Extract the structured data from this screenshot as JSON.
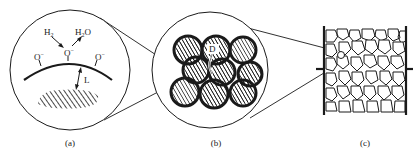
{
  "panels": [
    {
      "id": "a",
      "caption": "(a)",
      "labels": {
        "h2": "H",
        "h2_sub": "2",
        "h2o_pre": "H",
        "h2o_sub": "2",
        "h2o_post": "O",
        "o_center": "O",
        "o_left": "O",
        "o_right": "O",
        "charge": "−",
        "distance": "L"
      }
    },
    {
      "id": "b",
      "caption": "(b)",
      "labels": {
        "diameter": "D"
      }
    },
    {
      "id": "c",
      "caption": "(c)"
    }
  ],
  "colors": {
    "stroke": "#1a1a1a",
    "background": "#ffffff"
  }
}
